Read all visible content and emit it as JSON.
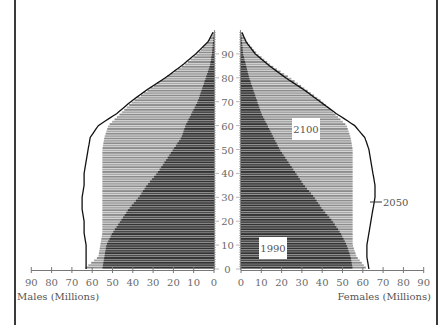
{
  "chart_data": {
    "type": "population-pyramid",
    "title": "",
    "xlabel_left": "Males (Millions)",
    "xlabel_right": "Females (Millions)",
    "ylabel": "Age",
    "x_ticks": [
      0,
      10,
      20,
      30,
      40,
      50,
      60,
      70,
      80,
      90
    ],
    "y_ticks": [
      0,
      10,
      20,
      30,
      40,
      50,
      60,
      70,
      80,
      90
    ],
    "xlim": [
      0,
      90
    ],
    "ylim": [
      0,
      99
    ],
    "grid": false,
    "legend": "inline labels",
    "ages": [
      0,
      5,
      10,
      15,
      20,
      25,
      30,
      35,
      40,
      45,
      50,
      55,
      60,
      65,
      70,
      75,
      80,
      85,
      90,
      95,
      99
    ],
    "series": [
      {
        "name": "2100",
        "style": "light gray hatched bars",
        "males": [
          64,
          57,
          56,
          55,
          55,
          55,
          55,
          55,
          55,
          55,
          55,
          54,
          52,
          46,
          40,
          32,
          24,
          15,
          8,
          3,
          0.5
        ],
        "females": [
          62,
          57,
          55,
          55,
          55,
          55,
          55,
          55,
          55,
          55,
          55,
          54,
          52,
          46,
          40,
          32,
          24,
          15,
          8,
          3,
          0.5
        ]
      },
      {
        "name": "1990",
        "style": "dark gray bars",
        "males": [
          55,
          54,
          53,
          50,
          46,
          42,
          37,
          33,
          28,
          24,
          20,
          16,
          14,
          11,
          8,
          6,
          4,
          2,
          1,
          0.5,
          0
        ],
        "females": [
          55,
          54,
          52,
          49,
          45,
          40,
          36,
          31,
          27,
          23,
          19,
          16,
          13,
          10,
          8,
          6,
          4,
          2.5,
          1,
          0.5,
          0
        ]
      },
      {
        "name": "2050",
        "style": "black outline curve",
        "males": [
          63,
          63,
          63,
          64,
          64,
          65,
          65,
          64,
          64,
          63,
          62,
          61,
          57,
          48,
          41,
          33,
          24,
          16,
          9,
          3,
          0.5
        ],
        "females": [
          63,
          62,
          62,
          63,
          64,
          65,
          66,
          66,
          65,
          64,
          63,
          61,
          56,
          47,
          39,
          31,
          22,
          14,
          7,
          2.5,
          0.5
        ]
      }
    ],
    "annotations": [
      {
        "text": "2100",
        "position": "females side, age ~55"
      },
      {
        "text": "1990",
        "position": "females side, age ~10"
      },
      {
        "text": "2050",
        "position": "right of females side, age ~27, leader line"
      }
    ]
  },
  "labels": {
    "males_axis": "Males (Millions)",
    "females_axis": "Females (Millions)",
    "label_2100": "2100",
    "label_1990": "1990",
    "label_2050": "2050"
  },
  "colors": {
    "bar_2100": "#9a9a9a",
    "bar_1990": "#3c3c3c",
    "line_2050": "#111111",
    "tick_text": "#6a6a6a"
  }
}
